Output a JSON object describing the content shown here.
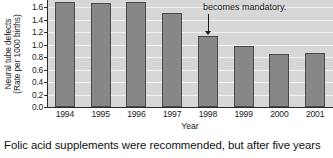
{
  "chart_data": {
    "type": "bar",
    "title": "",
    "xlabel": "Year",
    "ylabel_line1": "Neural tube defects",
    "ylabel_line2": "(Rate per 1000 births)",
    "categories": [
      "1994",
      "1995",
      "1996",
      "1997",
      "1998",
      "1999",
      "2000",
      "2001"
    ],
    "values": [
      1.68,
      1.66,
      1.68,
      1.51,
      1.13,
      0.98,
      0.85,
      0.86
    ],
    "value_labels": [
      "",
      "",
      "",
      "",
      "",
      "",
      "",
      ""
    ],
    "ylim": [
      0.0,
      1.6
    ],
    "ytick_labels": [
      "1.6",
      "1.4",
      "1.2",
      "1.0",
      "0.8",
      "0.6",
      "0.4",
      "0.2",
      "0.0"
    ],
    "ytick_values": [
      1.6,
      1.4,
      1.2,
      1.0,
      0.8,
      0.6,
      0.4,
      0.2,
      0.0
    ],
    "grid": true,
    "grid_color": "#f2f2f2",
    "legend": "none",
    "bar_color": "#878787",
    "bar_edge_color": "#4a4a4a",
    "plot_background": "#d7d7d7",
    "axis_color": "#2b2b2b",
    "annotations": [
      {
        "text": "becomes mandatory.",
        "points_to_category": "1998",
        "arrow": "down"
      }
    ]
  },
  "caption": {
    "text": "Folic acid supplements were recommended, but after five years"
  }
}
